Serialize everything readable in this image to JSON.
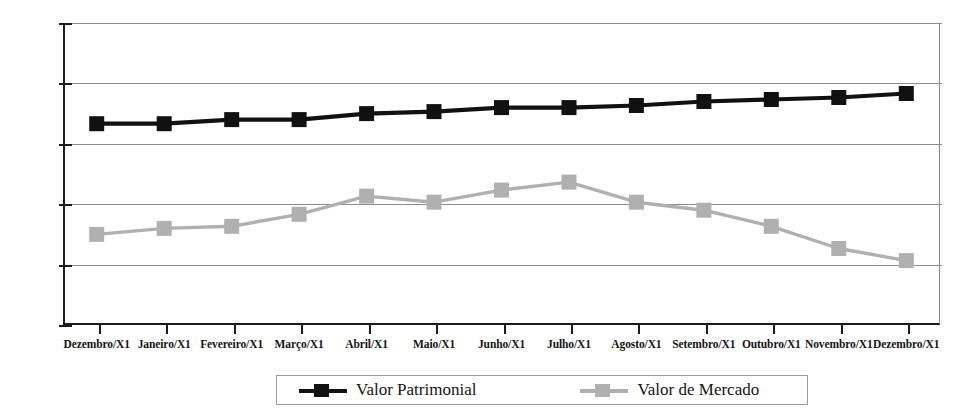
{
  "chart_data": {
    "type": "line",
    "title": "",
    "xlabel": "",
    "ylabel": "",
    "grid": true,
    "legend_position": "bottom",
    "ylim": [
      1.0,
      2.5
    ],
    "ytick_labels": [
      "2,50",
      "2,20",
      "1,90",
      "1,60",
      "1,30",
      "1,00"
    ],
    "ytick_values": [
      2.5,
      2.2,
      1.9,
      1.6,
      1.3,
      1.0
    ],
    "categories": [
      "Dezembro/X1",
      "Janeiro/X1",
      "Fevereiro/X1",
      "Março/X1",
      "Abril/X1",
      "Maio/X1",
      "Junho/X1",
      "Julho/X1",
      "Agosto/X1",
      "Setembro/X1",
      "Outubro/X1",
      "Novembro/X1",
      "Dezembro/X1"
    ],
    "series": [
      {
        "name": "Valor Patrimonial",
        "color": "#111111",
        "marker": "square",
        "values": [
          2.0,
          2.0,
          2.02,
          2.02,
          2.05,
          2.06,
          2.08,
          2.08,
          2.09,
          2.11,
          2.12,
          2.13,
          2.15
        ]
      },
      {
        "name": "Valor de Mercado",
        "color": "#b0b0b0",
        "marker": "square",
        "values": [
          1.45,
          1.48,
          1.49,
          1.55,
          1.64,
          1.61,
          1.67,
          1.71,
          1.61,
          1.57,
          1.49,
          1.38,
          1.32
        ]
      }
    ]
  },
  "legend": {
    "entries": [
      {
        "label": "Valor Patrimonial",
        "color": "#111111"
      },
      {
        "label": "Valor de Mercado",
        "color": "#b0b0b0"
      }
    ]
  },
  "axis": {
    "y_labels": [
      "2,50",
      "2,20",
      "1,90",
      "1,60",
      "1,30",
      "1,00"
    ]
  },
  "title_fragment": "."
}
